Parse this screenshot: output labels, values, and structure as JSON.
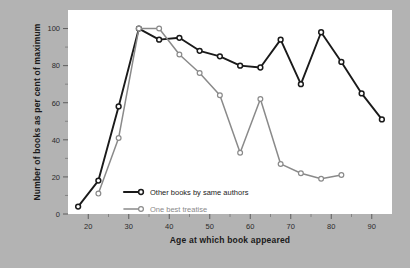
{
  "chart_data": {
    "type": "line",
    "title": "",
    "xlabel": "Age at which book appeared",
    "ylabel": "Number of books as per cent of maximum",
    "xlim": [
      15,
      95
    ],
    "ylim": [
      0,
      110
    ],
    "xticks": [
      20,
      30,
      40,
      50,
      60,
      70,
      80,
      90
    ],
    "xticks_minor": [
      25,
      35,
      45,
      55,
      65,
      75,
      85
    ],
    "yticks": [
      0,
      20,
      40,
      60,
      80,
      100
    ],
    "yticks_minor": [
      10,
      30,
      50,
      70,
      90
    ],
    "grid": false,
    "legend_position": "inside-bottom-left",
    "series": [
      {
        "name": "Other books by same authors",
        "color": "#1a1a1a",
        "marker": "open-circle",
        "x": [
          17.5,
          22.5,
          27.5,
          32.5,
          37.5,
          42.5,
          47.5,
          52.5,
          57.5,
          62.5,
          67.5,
          72.5,
          77.5,
          82.5,
          87.5,
          92.5
        ],
        "y": [
          4,
          18,
          58,
          100,
          94,
          95,
          88,
          85,
          80,
          79,
          94,
          70,
          98,
          82,
          65,
          51
        ]
      },
      {
        "name": "One best treatise",
        "color": "#8a8a8a",
        "marker": "open-circle",
        "x": [
          22.5,
          27.5,
          32.5,
          37.5,
          42.5,
          47.5,
          52.5,
          57.5,
          62.5,
          67.5,
          72.5,
          77.5,
          82.5
        ],
        "y": [
          11,
          41,
          100,
          100,
          86,
          76,
          64,
          33,
          62,
          27,
          22,
          19,
          21
        ]
      }
    ]
  },
  "legend": {
    "items": [
      {
        "label": "Other books by same authors",
        "color": "#1a1a1a"
      },
      {
        "label": "One best treatise",
        "color": "#8a8a8a"
      }
    ]
  },
  "axes": {
    "x_title": "Age at which book appeared",
    "y_title": "Number of books as per cent of maximum",
    "x_tick_labels": [
      "20",
      "30",
      "40",
      "50",
      "60",
      "70",
      "80",
      "90"
    ],
    "y_tick_labels": [
      "0",
      "20",
      "40",
      "60",
      "80",
      "100"
    ]
  },
  "colors": {
    "background": "#b3b3b3",
    "plot_background": "#ffffff",
    "series_primary": "#1a1a1a",
    "series_secondary": "#8a8a8a",
    "text": "#1a1a1a"
  }
}
